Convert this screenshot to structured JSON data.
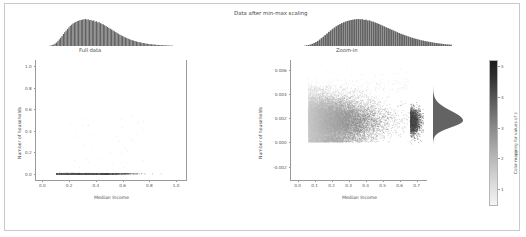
{
  "figure": {
    "suptitle": "Data after min-max scaling",
    "background": "#ffffff",
    "border_color": "#c9c9c9"
  },
  "chart_data": [
    {
      "type": "scatter",
      "name": "full-data-panel",
      "title": "Full data",
      "xlabel": "Median Income",
      "ylabel": "Number of households",
      "xlim": [
        -0.05,
        1.08
      ],
      "ylim": [
        -0.06,
        1.06
      ],
      "xticks": [
        0.0,
        0.2,
        0.4,
        0.6,
        0.8,
        1.0
      ],
      "xticklabels": [
        "0.0",
        "0.2",
        "0.4",
        "0.6",
        "0.8",
        "1.0"
      ],
      "yticks": [
        0.0,
        0.2,
        0.4,
        0.6,
        0.8,
        1.0
      ],
      "yticklabels": [
        "0.0",
        "0.2",
        "0.4",
        "0.6",
        "0.8",
        "1.0"
      ],
      "grid": false,
      "marginal_x": {
        "type": "histogram",
        "description": "right-skewed median income distribution, peak near 0.18",
        "bins": 90,
        "values": [
          2,
          4,
          7,
          11,
          17,
          24,
          34,
          46,
          58,
          70,
          84,
          97,
          108,
          120,
          131,
          142,
          150,
          158,
          164,
          169,
          175,
          178,
          181,
          184,
          186,
          188,
          190,
          186,
          188,
          182,
          184,
          178,
          180,
          172,
          174,
          166,
          168,
          160,
          156,
          152,
          146,
          140,
          134,
          128,
          122,
          116,
          110,
          104,
          98,
          92,
          86,
          80,
          75,
          70,
          65,
          60,
          56,
          52,
          48,
          44,
          41,
          38,
          35,
          32,
          29,
          27,
          25,
          23,
          21,
          19,
          17,
          16,
          14,
          13,
          12,
          11,
          10,
          9,
          8,
          7,
          7,
          6,
          6,
          5,
          5,
          4,
          4,
          3,
          3,
          3
        ]
      },
      "points_description": "all points compressed to y near 0, spanning x from 0 to 1.0",
      "n_points": 20640,
      "marker_color_range": [
        "#e8e8e8",
        "#1a1a1a"
      ]
    },
    {
      "type": "scatter",
      "name": "zoom-in-panel",
      "title": "Zoom-in",
      "xlabel": "Median Income",
      "ylabel": "Number of households",
      "xlim": [
        -0.04,
        0.76
      ],
      "ylim": [
        -0.0031,
        0.0068
      ],
      "xticks": [
        0.0,
        0.1,
        0.2,
        0.3,
        0.4,
        0.5,
        0.6,
        0.7
      ],
      "xticklabels": [
        "0.0",
        "0.1",
        "0.2",
        "0.3",
        "0.4",
        "0.5",
        "0.6",
        "0.7"
      ],
      "yticks": [
        -0.002,
        0.0,
        0.002,
        0.004,
        0.006
      ],
      "yticklabels": [
        "-0.002",
        "0.000",
        "0.002",
        "0.004",
        "0.006"
      ],
      "grid": false,
      "marginal_x": {
        "type": "histogram",
        "description": "broad right-skewed distribution peaking near x=0.28",
        "bins": 80,
        "values": [
          2,
          4,
          6,
          9,
          13,
          18,
          24,
          31,
          39,
          48,
          57,
          66,
          76,
          86,
          95,
          104,
          112,
          120,
          127,
          133,
          139,
          144,
          148,
          152,
          155,
          158,
          160,
          162,
          163,
          164,
          162,
          163,
          159,
          160,
          155,
          156,
          150,
          148,
          143,
          139,
          134,
          129,
          124,
          119,
          114,
          109,
          104,
          99,
          94,
          89,
          84,
          79,
          74,
          70,
          66,
          62,
          58,
          54,
          50,
          47,
          44,
          41,
          38,
          35,
          33,
          30,
          28,
          26,
          24,
          22,
          20,
          18,
          17,
          15,
          14,
          12,
          11,
          10,
          9,
          8
        ]
      },
      "marginal_y": {
        "type": "histogram",
        "description": "sharply peaked density near y=0.0018",
        "orientation": "horizontal",
        "peak_value": 0.0018
      },
      "points_description": "dense cloud between y=0.0005 and y=0.0045, widest at low x, tapering to the right",
      "n_points": 20640
    }
  ],
  "colorbar": {
    "label": "Color mapping for values of z",
    "ticks": [
      1,
      2,
      3,
      4,
      5
    ],
    "ticklabels": [
      "1",
      "2",
      "3",
      "4",
      "5"
    ],
    "vmin": 0.45,
    "vmax": 5.2,
    "cmap": "gray-reversed",
    "color_low": "#f2f2f2",
    "color_high": "#1c1c1c"
  }
}
